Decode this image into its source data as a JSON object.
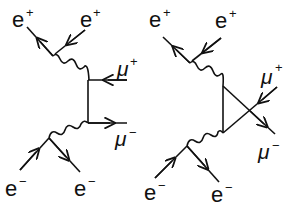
{
  "diagrams": [
    {
      "name": "tree-level",
      "labels": {
        "e_plus_out": "e",
        "e_plus_in": "e",
        "mu_plus": "μ",
        "mu_minus": "μ",
        "e_minus_in": "e",
        "e_minus_out": "e"
      }
    },
    {
      "name": "triangle-loop",
      "labels": {
        "e_plus_out": "e",
        "e_plus_in": "e",
        "mu_plus": "μ",
        "mu_minus": "μ",
        "e_minus_in": "e",
        "e_minus_out": "e"
      }
    }
  ],
  "charges": {
    "plus": "+",
    "minus": "−"
  }
}
